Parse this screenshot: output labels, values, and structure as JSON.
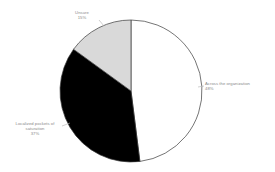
{
  "chart_data": {
    "type": "pie",
    "title": "",
    "subtitle": "",
    "xlabel": "",
    "ylabel": "",
    "legend_position": "none",
    "grid": false,
    "start_angle_deg": 0,
    "direction": "clockwise",
    "categories": [
      "Across the organization",
      "Localized pockets of saturation",
      "Unsure"
    ],
    "values": [
      48,
      37,
      15
    ],
    "value_unit": "%",
    "slices": [
      {
        "label": "Across the organization",
        "value": 48,
        "value_text": "48%",
        "color": "#ffffff",
        "edge_color": "#3a3a3a",
        "label_position": "right"
      },
      {
        "label": "Localized pockets of saturation",
        "value": 37,
        "value_text": "37%",
        "color": "#000000",
        "edge_color": "#3a3a3a",
        "label_position": "left"
      },
      {
        "label": "Unsure",
        "value": 15,
        "value_text": "15%",
        "color": "#d9d9d9",
        "edge_color": "#3a3a3a",
        "label_position": "top"
      }
    ]
  },
  "labels": {
    "right": {
      "name": "Across the organization",
      "pct": "48%"
    },
    "left": {
      "line1": "Localized pockets of",
      "line2": "saturation",
      "pct": "37%"
    },
    "top": {
      "name": "Unsure",
      "pct": "15%"
    }
  },
  "colors": {
    "background": "#ffffff",
    "slice_white": "#ffffff",
    "slice_black": "#000000",
    "slice_gray": "#d9d9d9",
    "outline": "#3a3a3a",
    "label_text": "#8a8a8a",
    "leader_line": "#b0b0b0"
  }
}
